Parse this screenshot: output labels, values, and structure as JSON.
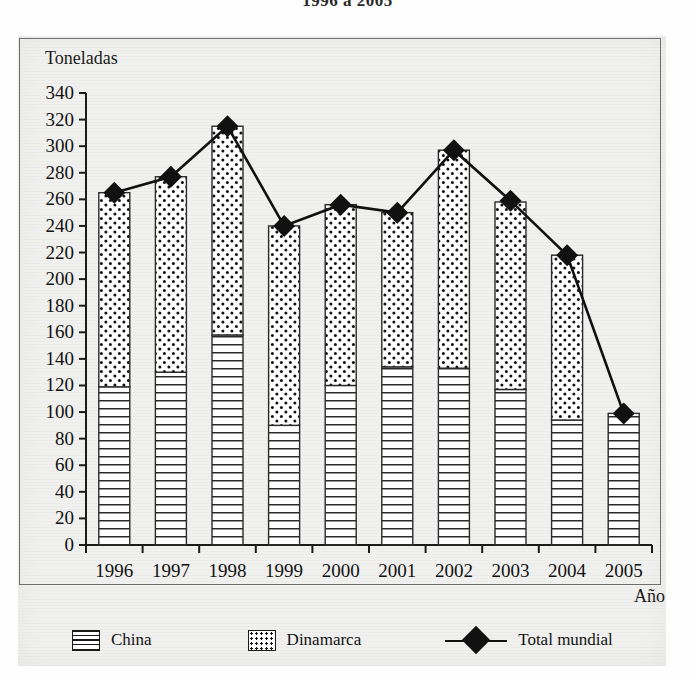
{
  "title": "1996 a 2005",
  "axes": {
    "ylabel": "Toneladas",
    "xlabel": "Año"
  },
  "legend": {
    "items": [
      {
        "label": "China",
        "pattern": "horizontal-lines",
        "color": "#1a1a1a"
      },
      {
        "label": "Dinamarca",
        "pattern": "dots",
        "color": "#1a1a1a"
      },
      {
        "label": "Total mundial",
        "pattern": "line-diamond",
        "color": "#111111"
      }
    ]
  },
  "chart_data": {
    "type": "bar",
    "subtype": "stacked-bar-with-line",
    "title": "1996 a 2005",
    "xlabel": "Año",
    "ylabel": "Toneladas",
    "ylim": [
      0,
      340
    ],
    "ytick_step": 20,
    "yticks": [
      0,
      20,
      40,
      60,
      80,
      100,
      120,
      140,
      160,
      180,
      200,
      220,
      240,
      260,
      280,
      300,
      320,
      340
    ],
    "grid": false,
    "legend_position": "bottom",
    "categories": [
      "1996",
      "1997",
      "1998",
      "1999",
      "2000",
      "2001",
      "2002",
      "2003",
      "2004",
      "2005"
    ],
    "series": [
      {
        "name": "China",
        "type": "bar-segment",
        "values": [
          119,
          130,
          158,
          90,
          120,
          134,
          133,
          117,
          94,
          99
        ]
      },
      {
        "name": "Dinamarca",
        "type": "bar-segment",
        "values": [
          146,
          147,
          157,
          150,
          136,
          116,
          164,
          141,
          124,
          0
        ]
      },
      {
        "name": "Total mundial",
        "type": "line",
        "marker": "diamond",
        "values": [
          265,
          277,
          315,
          240,
          256,
          250,
          297,
          259,
          218,
          99
        ]
      }
    ]
  },
  "ytick_labels": [
    "340",
    "320",
    "300",
    "280",
    "260",
    "240",
    "220",
    "200",
    "180",
    "160",
    "140",
    "120",
    "100",
    "80",
    "60",
    "40",
    "20",
    "0"
  ],
  "xtick_labels": [
    "1996",
    "1997",
    "1998",
    "1999",
    "2000",
    "2001",
    "2002",
    "2003",
    "2004",
    "2005"
  ]
}
